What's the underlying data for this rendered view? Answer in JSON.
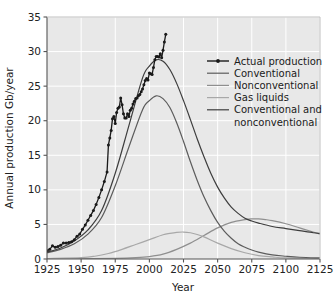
{
  "chart_data": {
    "type": "line",
    "title": "",
    "xlabel": "Year",
    "ylabel": "Annual production Gb/year",
    "xlim": [
      1925,
      2125
    ],
    "ylim": [
      0,
      35
    ],
    "xticks": [
      1925,
      1950,
      1975,
      2000,
      2025,
      2050,
      2075,
      2100,
      2125
    ],
    "yticks": [
      0,
      5,
      10,
      15,
      20,
      25,
      30,
      35
    ],
    "grid": true,
    "legend_position": "upper right",
    "series": [
      {
        "name": "Actual production",
        "color": "#1a1a1a",
        "marker": "dot",
        "x": [
          1925,
          1927,
          1929,
          1931,
          1933,
          1935,
          1937,
          1939,
          1941,
          1943,
          1945,
          1947,
          1949,
          1951,
          1953,
          1955,
          1957,
          1959,
          1961,
          1963,
          1965,
          1967,
          1969,
          1970,
          1971,
          1972,
          1973,
          1974,
          1975,
          1976,
          1977,
          1978,
          1979,
          1980,
          1981,
          1982,
          1983,
          1984,
          1985,
          1986,
          1987,
          1988,
          1989,
          1990,
          1991,
          1992,
          1993,
          1994,
          1995,
          1996,
          1997,
          1998,
          1999,
          2000,
          2001,
          2002,
          2003,
          2004,
          2005,
          2006,
          2007,
          2008,
          2009,
          2010,
          2011,
          2012
        ],
        "y": [
          1.2,
          1.4,
          1.9,
          1.7,
          1.8,
          2.0,
          2.3,
          2.3,
          2.4,
          2.5,
          2.8,
          3.3,
          3.6,
          4.3,
          4.9,
          5.6,
          6.3,
          7.0,
          7.9,
          8.9,
          10.0,
          11.2,
          12.6,
          16.5,
          17.5,
          18.6,
          20.3,
          20.6,
          19.6,
          21.2,
          21.8,
          22.0,
          23.3,
          22.3,
          21.0,
          20.4,
          20.4,
          21.0,
          20.6,
          21.5,
          21.8,
          22.4,
          22.8,
          23.2,
          23.3,
          23.6,
          23.8,
          24.2,
          24.6,
          25.2,
          25.8,
          26.1,
          25.9,
          26.9,
          26.8,
          26.7,
          27.7,
          28.8,
          29.3,
          29.3,
          29.2,
          29.7,
          29.1,
          30.2,
          31.4,
          32.5
        ]
      },
      {
        "name": "Conventional",
        "color": "#5c5c5c",
        "marker": "none",
        "peak_year": 2005,
        "peak_value": 23.6,
        "x": [
          1925,
          1935,
          1945,
          1955,
          1965,
          1975,
          1985,
          1995,
          2000,
          2005,
          2010,
          2015,
          2020,
          2025,
          2030,
          2035,
          2040,
          2045,
          2050,
          2055,
          2060,
          2065,
          2070,
          2075,
          2080,
          2090,
          2100,
          2110,
          2125
        ],
        "y": [
          0.9,
          1.4,
          2.2,
          3.6,
          6.0,
          10.6,
          16.2,
          21.6,
          22.9,
          23.6,
          23.2,
          21.9,
          19.7,
          17.0,
          14.1,
          11.4,
          9.0,
          7.0,
          5.3,
          4.0,
          3.0,
          2.2,
          1.7,
          1.3,
          1.0,
          0.6,
          0.4,
          0.25,
          0.15
        ]
      },
      {
        "name": "Nonconventional",
        "color": "#8f8f8f",
        "marker": "none",
        "peak_year": 2078,
        "peak_value": 5.8,
        "x": [
          1925,
          1950,
          1975,
          1990,
          2000,
          2010,
          2020,
          2030,
          2040,
          2050,
          2060,
          2070,
          2075,
          2080,
          2085,
          2090,
          2100,
          2110,
          2120,
          2125
        ],
        "y": [
          0.02,
          0.05,
          0.1,
          0.2,
          0.35,
          0.7,
          1.4,
          2.3,
          3.4,
          4.5,
          5.3,
          5.7,
          5.8,
          5.8,
          5.7,
          5.55,
          5.1,
          4.5,
          3.9,
          3.6
        ]
      },
      {
        "name": "Gas liquids",
        "color": "#a8a8a8",
        "marker": "none",
        "peak_year": 2025,
        "peak_value": 3.9,
        "x": [
          1925,
          1950,
          1960,
          1970,
          1980,
          1990,
          2000,
          2010,
          2015,
          2020,
          2025,
          2030,
          2035,
          2040,
          2050,
          2060,
          2070,
          2080,
          2090,
          2100,
          2125
        ],
        "y": [
          0.05,
          0.2,
          0.4,
          0.8,
          1.4,
          2.1,
          2.8,
          3.5,
          3.7,
          3.85,
          3.9,
          3.8,
          3.55,
          3.2,
          2.3,
          1.5,
          0.9,
          0.5,
          0.3,
          0.15,
          0.05
        ]
      },
      {
        "name": "Conventional and nonconventional",
        "color": "#3d3d3d",
        "marker": "none",
        "peak_year": 2005,
        "peak_value": 28.8,
        "x": [
          1925,
          1935,
          1945,
          1955,
          1965,
          1975,
          1985,
          1995,
          2000,
          2005,
          2010,
          2015,
          2020,
          2025,
          2030,
          2035,
          2040,
          2045,
          2050,
          2055,
          2060,
          2065,
          2070,
          2075,
          2080,
          2090,
          2100,
          2110,
          2120,
          2125
        ],
        "y": [
          1.0,
          1.6,
          2.6,
          4.2,
          7.0,
          12.4,
          19.3,
          26.2,
          27.9,
          28.8,
          28.6,
          27.4,
          25.4,
          22.9,
          20.2,
          17.4,
          14.8,
          12.4,
          10.4,
          8.8,
          7.5,
          6.6,
          5.9,
          5.5,
          5.2,
          4.7,
          4.4,
          4.1,
          3.8,
          3.7
        ]
      }
    ]
  },
  "legend": {
    "entries": [
      {
        "label": "Actual production",
        "color": "#1a1a1a",
        "marker": true
      },
      {
        "label": "Conventional",
        "color": "#5c5c5c",
        "marker": false
      },
      {
        "label": "Nonconventional",
        "color": "#8f8f8f",
        "marker": false
      },
      {
        "label": "Gas liquids",
        "color": "#a8a8a8",
        "marker": false
      },
      {
        "label": "Conventional and",
        "color": "#3d3d3d",
        "marker": false
      },
      {
        "label": "nonconventional",
        "color": "",
        "marker": false
      }
    ]
  },
  "style": {
    "plot_background": "#e8e8e8",
    "gridline_color": "#ffffff",
    "axis_color": "#555555",
    "text_color": "#222222"
  }
}
